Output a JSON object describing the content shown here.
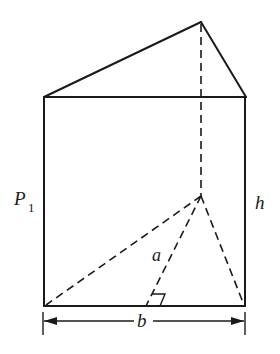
{
  "diagram": {
    "type": "triangular-prism",
    "labels": {
      "lateral_face": "P",
      "lateral_face_subscript": "1",
      "height": "h",
      "base_altitude": "a",
      "base_side": "b"
    },
    "colors": {
      "stroke": "#1a1a1a",
      "background": "#ffffff"
    },
    "vertices": {
      "top_left": [
        44,
        97
      ],
      "top_right": [
        246,
        97
      ],
      "top_back": [
        201,
        22
      ],
      "bottom_left": [
        44,
        306
      ],
      "bottom_right": [
        245,
        306
      ],
      "bottom_back": [
        201,
        196
      ],
      "altitude_foot": [
        146,
        306
      ]
    },
    "dimension_line": {
      "y": 321,
      "x_start": 44,
      "x_end": 245
    }
  }
}
